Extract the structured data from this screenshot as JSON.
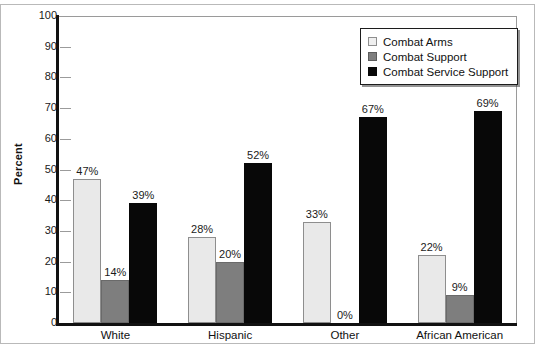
{
  "chart_data": {
    "type": "bar",
    "title": "",
    "subtitle": "",
    "xlabel": "",
    "ylabel": "Percent",
    "ylim": [
      0,
      100
    ],
    "yticks": [
      0,
      10,
      20,
      30,
      40,
      50,
      60,
      70,
      80,
      90,
      100
    ],
    "grid": false,
    "legend_position": "top-right",
    "categories": [
      "White",
      "Hispanic",
      "Other",
      "African American"
    ],
    "series": [
      {
        "name": "Combat Arms",
        "color": "#e9e9e9",
        "values": [
          47,
          28,
          33,
          22
        ],
        "labels": [
          "47%",
          "28%",
          "33%",
          "22%"
        ]
      },
      {
        "name": "Combat Support",
        "color": "#7e7e7e",
        "values": [
          14,
          20,
          0,
          9
        ],
        "labels": [
          "14%",
          "20%",
          "0%",
          "9%"
        ]
      },
      {
        "name": "Combat Service Support",
        "color": "#080808",
        "values": [
          39,
          52,
          67,
          69
        ],
        "labels": [
          "39%",
          "52%",
          "67%",
          "69%"
        ]
      }
    ]
  }
}
